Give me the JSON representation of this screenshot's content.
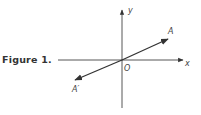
{
  "caption": "Figure 1.",
  "axes": {
    "x_label": "x",
    "y_label": "y",
    "origin_label": "O"
  },
  "vectors": [
    {
      "label": "A",
      "direction": "up-right"
    },
    {
      "label": "A′",
      "direction": "down-left"
    }
  ],
  "colors": {
    "ink": "#333333",
    "background": "#ffffff"
  }
}
